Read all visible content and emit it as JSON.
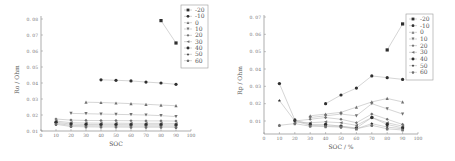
{
  "chart_data": [
    {
      "type": "line",
      "title": "",
      "xlabel": "SOC",
      "ylabel": "Ro / Ohm",
      "xlim": [
        0,
        100
      ],
      "ylim": [
        0.01,
        0.08
      ],
      "x_ticks": [
        "0",
        "10",
        "20",
        "30",
        "40",
        "50",
        "60",
        "70",
        "80",
        "90",
        "100"
      ],
      "y_ticks": [
        "0.01",
        "0.02",
        "0.03",
        "0.04",
        "0.05",
        "0.06",
        "0.07",
        "0.08"
      ],
      "grid": false,
      "legend_position": "top-right",
      "series": [
        {
          "name": "-20",
          "marker": "square",
          "x": [
            80,
            90
          ],
          "values": [
            0.079,
            0.065
          ]
        },
        {
          "name": "-10",
          "marker": "circle",
          "x": [
            40,
            50,
            60,
            70,
            80,
            90
          ],
          "values": [
            0.042,
            0.0417,
            0.0413,
            0.0406,
            0.04,
            0.0392
          ]
        },
        {
          "name": "0",
          "marker": "triangle-up",
          "x": [
            30,
            40,
            50,
            60,
            70,
            80,
            90
          ],
          "values": [
            0.028,
            0.0278,
            0.0275,
            0.0271,
            0.0267,
            0.0262,
            0.0258
          ]
        },
        {
          "name": "10",
          "marker": "triangle-down",
          "x": [
            20,
            30,
            40,
            50,
            60,
            70,
            80,
            90
          ],
          "values": [
            0.021,
            0.0208,
            0.0206,
            0.0204,
            0.0202,
            0.02,
            0.0196,
            0.019
          ]
        },
        {
          "name": "20",
          "marker": "diamond",
          "x": [
            10,
            20,
            30,
            40,
            50,
            60,
            70,
            80,
            90
          ],
          "values": [
            0.0175,
            0.0168,
            0.0166,
            0.0165,
            0.0165,
            0.0164,
            0.0163,
            0.0163,
            0.0162
          ]
        },
        {
          "name": "30",
          "marker": "triangle-left",
          "x": [
            10,
            20,
            30,
            40,
            50,
            60,
            70,
            80,
            90
          ],
          "values": [
            0.0162,
            0.0152,
            0.015,
            0.0149,
            0.0149,
            0.0148,
            0.0148,
            0.0148,
            0.0147
          ]
        },
        {
          "name": "40",
          "marker": "hexagon",
          "x": [
            10,
            20,
            30,
            40,
            50,
            60,
            70,
            80,
            90
          ],
          "values": [
            0.0155,
            0.0143,
            0.0141,
            0.014,
            0.014,
            0.0139,
            0.0139,
            0.0139,
            0.0138
          ]
        },
        {
          "name": "50",
          "marker": "star",
          "x": [
            10,
            20,
            30,
            40,
            50,
            60,
            70,
            80,
            90
          ],
          "values": [
            0.0148,
            0.0135,
            0.0133,
            0.0132,
            0.0132,
            0.0131,
            0.0131,
            0.0131,
            0.013
          ]
        },
        {
          "name": "60",
          "marker": "pentagon",
          "x": [
            10,
            20,
            30,
            40,
            50,
            60,
            70,
            80,
            90
          ],
          "values": [
            0.0142,
            0.0128,
            0.0126,
            0.0125,
            0.0125,
            0.0124,
            0.0124,
            0.0124,
            0.0123
          ]
        }
      ]
    },
    {
      "type": "line",
      "title": "",
      "xlabel": "SOC / %",
      "ylabel": "Rp / Ohm",
      "xlim": [
        0,
        100
      ],
      "ylim": [
        0.005,
        0.07
      ],
      "x_ticks": [
        "0",
        "10",
        "20",
        "30",
        "40",
        "50",
        "60",
        "70",
        "80",
        "90",
        "100"
      ],
      "y_ticks": [
        "0.01",
        "0.02",
        "0.03",
        "0.04",
        "0.05",
        "0.06",
        "0.07"
      ],
      "grid": false,
      "legend_position": "top-right",
      "series": [
        {
          "name": "-20",
          "marker": "square",
          "x": [
            80,
            90
          ],
          "values": [
            0.051,
            0.066
          ]
        },
        {
          "name": "-10",
          "marker": "circle",
          "x": [
            40,
            50,
            60,
            70,
            80,
            90
          ],
          "values": [
            0.02,
            0.025,
            0.029,
            0.036,
            0.035,
            0.034
          ]
        },
        {
          "name": "0",
          "marker": "triangle-up",
          "x": [
            30,
            40,
            50,
            60,
            70,
            80,
            90
          ],
          "values": [
            0.013,
            0.014,
            0.015,
            0.018,
            0.021,
            0.023,
            0.021
          ]
        },
        {
          "name": "10",
          "marker": "triangle-down",
          "x": [
            30,
            40,
            50,
            60,
            70,
            80,
            90
          ],
          "values": [
            0.012,
            0.013,
            0.014,
            0.013,
            0.02,
            0.017,
            0.014
          ]
        },
        {
          "name": "20",
          "marker": "diamond",
          "x": [
            20,
            30,
            40,
            50,
            60,
            70,
            80,
            90
          ],
          "values": [
            0.01,
            0.011,
            0.012,
            0.011,
            0.009,
            0.014,
            0.011,
            0.008
          ]
        },
        {
          "name": "30",
          "marker": "triangle-left",
          "x": [
            20,
            30,
            40,
            50,
            60,
            70,
            80,
            90
          ],
          "values": [
            0.0095,
            0.009,
            0.0095,
            0.009,
            0.0075,
            0.012,
            0.009,
            0.007
          ]
        },
        {
          "name": "40",
          "marker": "hexagon",
          "x": [
            10,
            20,
            30,
            40,
            50,
            60,
            70,
            80,
            90
          ],
          "values": [
            0.0316,
            0.0106,
            0.008,
            0.008,
            0.007,
            0.006,
            0.012,
            0.008,
            0.006
          ]
        },
        {
          "name": "50",
          "marker": "star",
          "x": [
            10,
            20,
            30,
            40,
            50,
            60,
            70,
            80,
            90
          ],
          "values": [
            0.0218,
            0.01,
            0.0075,
            0.0072,
            0.007,
            0.0055,
            0.0085,
            0.0065,
            0.0055
          ]
        },
        {
          "name": "60",
          "marker": "pentagon",
          "x": [
            10,
            20,
            30,
            40,
            50,
            60,
            70,
            80,
            90
          ],
          "values": [
            0.0075,
            0.0085,
            0.007,
            0.0068,
            0.0065,
            0.0055,
            0.0075,
            0.0055,
            0.0048
          ]
        }
      ]
    }
  ],
  "left": {
    "xlabel": "SOC",
    "ylabel": "Ro / Ohm"
  },
  "right": {
    "xlabel": "SOC / %",
    "ylabel": "Rp / Ohm"
  },
  "legend": [
    "-20",
    "-10",
    "0",
    "10",
    "20",
    "30",
    "40",
    "50",
    "60"
  ],
  "colors": {
    "axis": "#8a8a8a",
    "marker": "#2f2f2f",
    "marker_light": "#707070",
    "line": "#b8b8b8",
    "text": "#777777"
  }
}
